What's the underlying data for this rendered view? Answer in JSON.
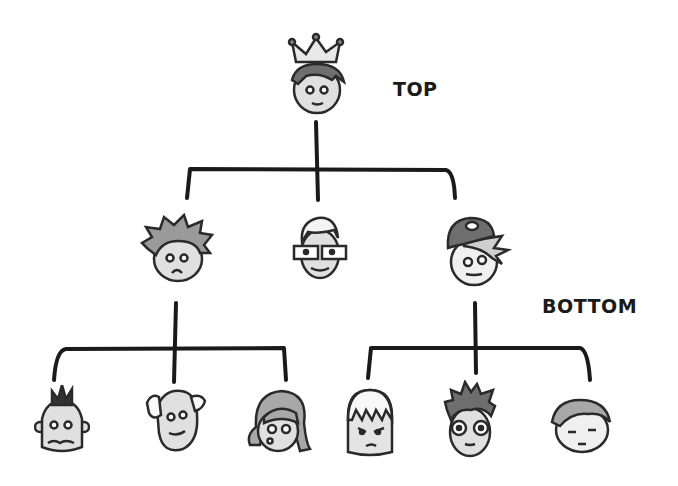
{
  "diagram": {
    "type": "hierarchy",
    "labels": {
      "top": "TOP",
      "bottom": "BOTTOM"
    },
    "colors": {
      "line": "#1a1a1a",
      "skin": "#e0e0e0",
      "hair_dark": "#5a5a5a",
      "hair_mid": "#8c8c8c",
      "hair_light": "#b5b5b5"
    },
    "nodes": [
      {
        "id": "root",
        "level": 0,
        "name": "crowned-leader-face"
      },
      {
        "id": "mid-1",
        "level": 1,
        "parent": "root",
        "name": "worried-spiky-hair-face"
      },
      {
        "id": "mid-2",
        "level": 1,
        "parent": "root",
        "name": "glasses-white-hair-face"
      },
      {
        "id": "mid-3",
        "level": 1,
        "parent": "root",
        "name": "cap-wearing-face"
      },
      {
        "id": "leaf-1",
        "level": 2,
        "parent": "mid-1",
        "name": "mohawk-nervous-face"
      },
      {
        "id": "leaf-2",
        "level": 2,
        "parent": "mid-1",
        "name": "balding-old-face"
      },
      {
        "id": "leaf-3",
        "level": 2,
        "parent": "mid-1",
        "name": "surprised-girl-face"
      },
      {
        "id": "leaf-4",
        "level": 2,
        "parent": "mid-3",
        "name": "grumpy-bangs-face"
      },
      {
        "id": "leaf-5",
        "level": 2,
        "parent": "mid-3",
        "name": "round-glasses-face"
      },
      {
        "id": "leaf-6",
        "level": 2,
        "parent": "mid-3",
        "name": "sleepy-face"
      }
    ]
  }
}
